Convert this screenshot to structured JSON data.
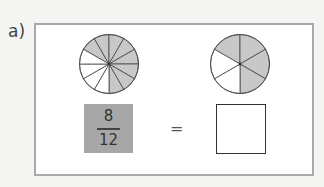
{
  "question": {
    "label": "a)",
    "left_pie": {
      "sectors": 12,
      "shaded": 8,
      "shade_color": "#c8c8c8"
    },
    "right_pie": {
      "sectors": 6,
      "shaded": 4,
      "shade_color": "#c8c8c8"
    },
    "fraction": {
      "numerator": "8",
      "denominator": "12",
      "box_color": "#a7a7a7"
    },
    "equals": "=",
    "answer": ""
  }
}
